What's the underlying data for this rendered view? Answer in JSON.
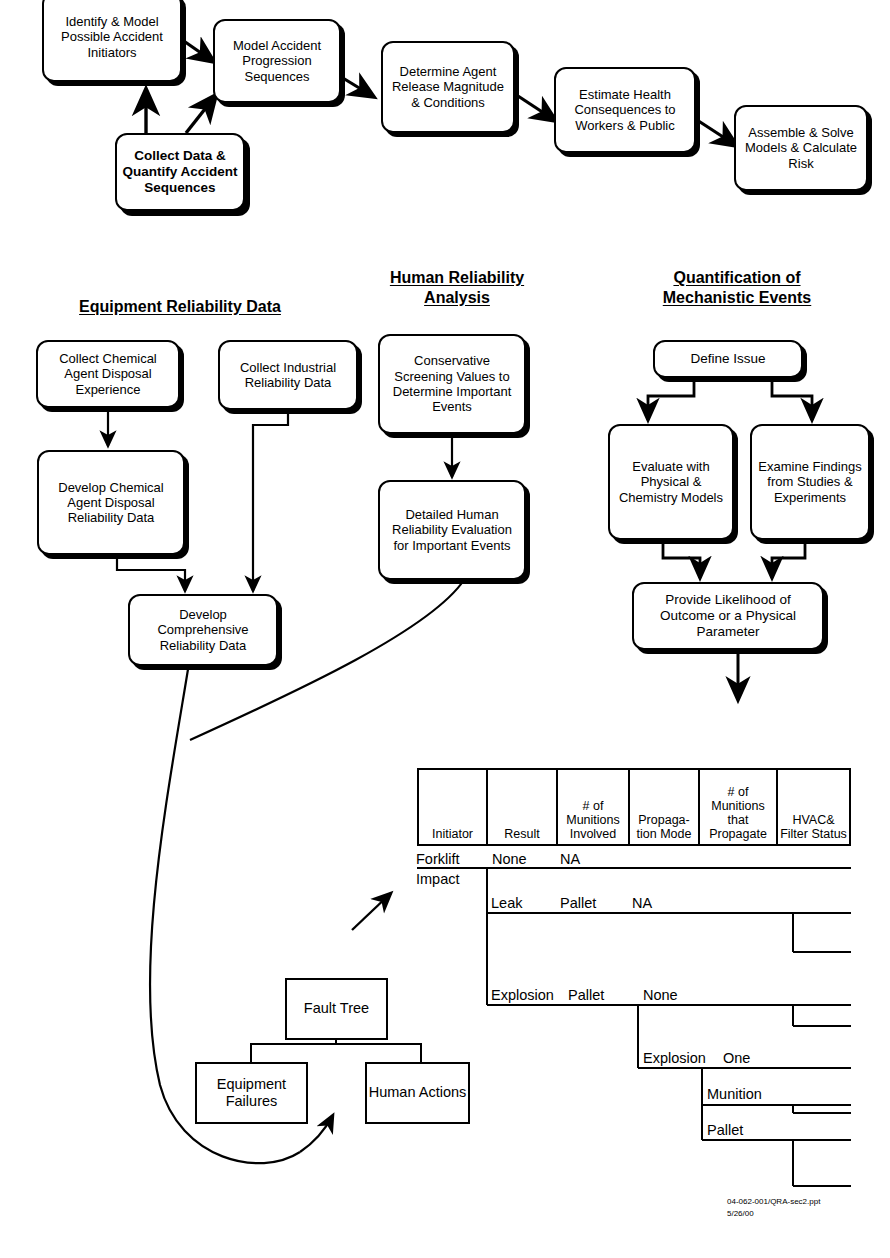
{
  "top_flow": {
    "boxes": [
      {
        "id": "identify-model",
        "label": "Identify & Model Possible Accident Initiators"
      },
      {
        "id": "model-progression",
        "label": "Model Accident Progression Sequences"
      },
      {
        "id": "determine-agent-release",
        "label": "Determine Agent Release Magnitude & Conditions"
      },
      {
        "id": "estimate-health",
        "label": "Estimate Health Consequences to Workers & Public"
      },
      {
        "id": "assemble-solve",
        "label": "Assemble & Solve Models & Calculate Risk"
      },
      {
        "id": "collect-data-quantify",
        "label": "Collect Data & Quantify Accident Sequences"
      }
    ]
  },
  "sections": [
    {
      "id": "equipment-reliability-data",
      "line1": "Equipment Reliability Data",
      "line2": ""
    },
    {
      "id": "human-reliability-analysis",
      "line1": "Human Reliability",
      "line2": "Analysis"
    },
    {
      "id": "quantification-mechanistic-events",
      "line1": "Quantification of",
      "line2": "Mechanistic Events"
    }
  ],
  "equipment_column": {
    "boxes": [
      {
        "id": "collect-chemical-agent",
        "label": "Collect Chemical Agent Disposal Experience"
      },
      {
        "id": "collect-industrial",
        "label": "Collect Industrial Reliability Data"
      },
      {
        "id": "develop-chemical-agent",
        "label": "Develop Chemical Agent Disposal Reliability Data"
      },
      {
        "id": "develop-comprehensive",
        "label": "Develop Comprehensive Reliability Data"
      }
    ]
  },
  "human_column": {
    "boxes": [
      {
        "id": "conservative-screening",
        "label": "Conservative Screening Values to Determine Important Events"
      },
      {
        "id": "detailed-human-reliability",
        "label": "Detailed Human Reliability Evaluation for Important Events"
      }
    ]
  },
  "mechanistic_column": {
    "boxes": [
      {
        "id": "define-issue",
        "label": "Define Issue"
      },
      {
        "id": "evaluate-physical",
        "label": "Evaluate with Physical & Chemistry Models"
      },
      {
        "id": "examine-findings",
        "label": "Examine Findings from Studies & Experiments"
      },
      {
        "id": "provide-likelihood",
        "label": "Provide Likelihood of Outcome or a Physical Parameter"
      }
    ]
  },
  "fault_tree": {
    "boxes": [
      {
        "id": "fault-tree-top",
        "label": "Fault Tree"
      },
      {
        "id": "equipment-failures",
        "label": "Equipment Failures"
      },
      {
        "id": "human-actions",
        "label": "Human Actions"
      }
    ],
    "gate": "or-gate-symbol"
  },
  "event_tree": {
    "columns": [
      {
        "id": "initiator",
        "header": "Initiator"
      },
      {
        "id": "result",
        "header": "Result"
      },
      {
        "id": "munitions-involved",
        "header": "# of Munitions Involved"
      },
      {
        "id": "propagation-mode",
        "header": "Propaga- tion Mode"
      },
      {
        "id": "munitions-propagate",
        "header": "# of Munitions that Propagate"
      },
      {
        "id": "hvac-filter-status",
        "header": "HVAC& Filter Status"
      }
    ],
    "labels": [
      {
        "id": "initiator-forklift",
        "text": "Forklift"
      },
      {
        "id": "initiator-impact",
        "text": "Impact"
      },
      {
        "id": "result-none",
        "text": "None"
      },
      {
        "id": "munitions-na-1",
        "text": "NA"
      },
      {
        "id": "result-leak",
        "text": "Leak"
      },
      {
        "id": "munitions-pallet-1",
        "text": "Pallet"
      },
      {
        "id": "propagation-na",
        "text": "NA"
      },
      {
        "id": "result-explosion",
        "text": "Explosion"
      },
      {
        "id": "munitions-pallet-2",
        "text": "Pallet"
      },
      {
        "id": "propagation-none",
        "text": "None"
      },
      {
        "id": "propagation-explosion",
        "text": "Explosion"
      },
      {
        "id": "propagate-one",
        "text": "One"
      },
      {
        "id": "propagate-munition",
        "text": "Munition"
      },
      {
        "id": "propagate-pallet",
        "text": "Pallet"
      }
    ]
  },
  "footer": {
    "line1": "04-062-001/QRA-sec2.ppt",
    "line2": "5/26/00"
  }
}
